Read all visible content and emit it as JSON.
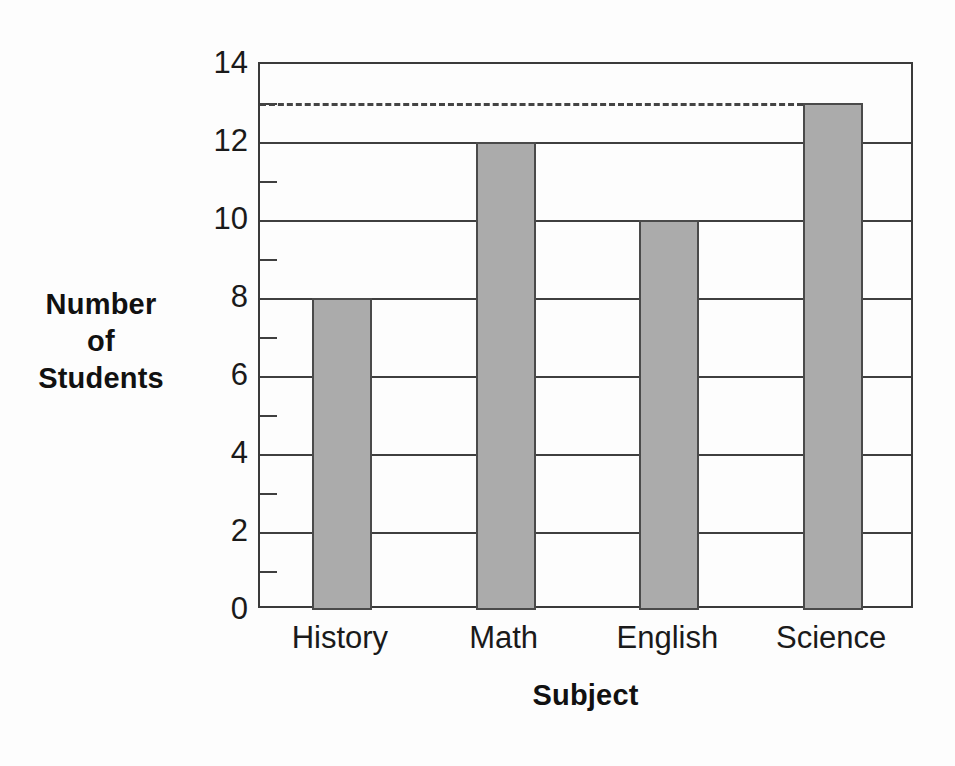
{
  "chart_data": {
    "type": "bar",
    "title": "",
    "subtitle": "",
    "xlabel": "Subject",
    "ylabel": "Number of Students",
    "ylabel_lines": [
      "Number",
      "of",
      "Students"
    ],
    "categories": [
      "History",
      "Math",
      "English",
      "Science"
    ],
    "values": [
      8,
      12,
      10,
      13
    ],
    "ylim": [
      0,
      14
    ],
    "xlim_categories": 4,
    "y_major_ticks": [
      0,
      2,
      4,
      6,
      8,
      10,
      12,
      14
    ],
    "y_major_tick_labels": [
      "0",
      "2",
      "4",
      "6",
      "8",
      "10",
      "12",
      "14"
    ],
    "y_minor_ticks": [
      1,
      3,
      5,
      7,
      9,
      11,
      13
    ],
    "grid": "horizontal-major",
    "legend": "none",
    "annotations": [
      {
        "kind": "reference-line",
        "style": "dashed",
        "orientation": "horizontal",
        "y_value": 13,
        "label": "",
        "extends_to_category": "Science"
      }
    ],
    "bar_fill_color": "#ababab",
    "bar_edge_color": "#4a4a4a",
    "axis_color": "#3a3a3a",
    "grid_color": "#3f3f3f",
    "background_color": "#fdfdfd",
    "reference_line_color": "#444444"
  }
}
